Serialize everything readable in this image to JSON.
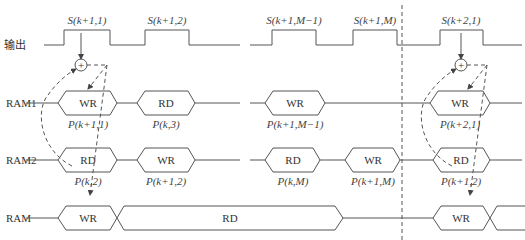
{
  "rows": {
    "output": "输出",
    "ram1": "RAM1",
    "ram2": "RAM2",
    "ram": "RAM"
  },
  "pulses": [
    "S(k+1,1)",
    "S(k+1,2)",
    "S(k+1,M−1)",
    "S(k+1,M)",
    "S(k+2,1)"
  ],
  "ram1": [
    {
      "op": "WR",
      "sub": "P(k+1,1)"
    },
    {
      "op": "RD",
      "sub": "P(k,3)"
    },
    {
      "op": "WR",
      "sub": "P(k+1,M−1)"
    },
    {
      "op": "WR",
      "sub": "P(k+2,1)"
    }
  ],
  "ram2": [
    {
      "op": "RD",
      "sub": "P(k,2)"
    },
    {
      "op": "WR",
      "sub": "P(k+1,2)"
    },
    {
      "op": "RD",
      "sub": "P(k,M)"
    },
    {
      "op": "WR",
      "sub": "P(k+1,M)"
    },
    {
      "op": "RD",
      "sub": "P(k+1,2)"
    }
  ],
  "ram": [
    {
      "op": "WR"
    },
    {
      "op": "RD"
    },
    {
      "op": "WR"
    }
  ],
  "adder_symbol": "+"
}
